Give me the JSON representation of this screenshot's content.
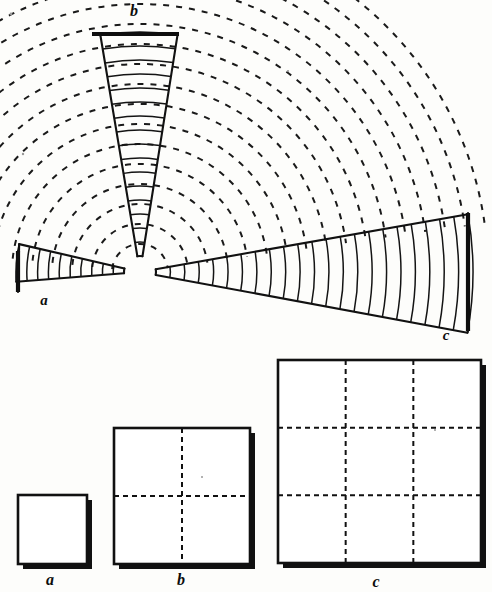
{
  "figure": {
    "background_color": "#fdfdfb",
    "ink_color": "#111111",
    "source_point": {
      "x": 140,
      "y": 272
    }
  },
  "beams": [
    {
      "id": "a",
      "label": "a",
      "label_x": 44,
      "label_y": 305,
      "distance_units": 1,
      "rung_count": 10,
      "direction": "left",
      "start_angle_deg": 175.5,
      "end_angle_deg": 193.0,
      "inner_radius": 16,
      "outer_radius": 124,
      "cap_x": 18,
      "cap_top_y": 251,
      "cap_bottom_y": 292
    },
    {
      "id": "b",
      "label": "b",
      "label_x": 134,
      "label_y": 16,
      "distance_units": 2,
      "rung_count": 16,
      "direction": "up",
      "start_angle_deg": 260.5,
      "end_angle_deg": 279.0,
      "inner_radius": 16,
      "outer_radius": 240,
      "cap_left_x": 92,
      "cap_right_x": 179,
      "cap_y": 34
    },
    {
      "id": "c",
      "label": "c",
      "label_x": 446,
      "label_y": 340,
      "distance_units": 3,
      "rung_count": 22,
      "direction": "right",
      "start_angle_deg": -10.0,
      "end_angle_deg": 10.5,
      "inner_radius": 16,
      "outer_radius": 333,
      "cap_x": 468,
      "cap_top_y": 213,
      "cap_bottom_y": 331
    }
  ],
  "wavefronts": {
    "style": "dashed",
    "dash_pattern": "6 7",
    "arc_count": 17,
    "radius_start": 28,
    "radius_step": 20,
    "sweep_start_angle_deg": 186,
    "sweep_end_angle_deg": 352,
    "stroke_width": 2.0
  },
  "squares": [
    {
      "id": "a",
      "label": "a",
      "label_x": 50,
      "label_y": 585,
      "x": 18,
      "y": 495,
      "size": 69,
      "divisions": 1,
      "area_units": 1,
      "grid_visible": false
    },
    {
      "id": "b",
      "label": "b",
      "label_x": 181,
      "label_y": 585,
      "x": 114,
      "y": 428,
      "size": 136,
      "divisions": 2,
      "area_units": 4,
      "grid_visible": true
    },
    {
      "id": "c",
      "label": "c",
      "label_x": 376,
      "label_y": 587,
      "x": 278,
      "y": 360,
      "size": 203,
      "divisions": 3,
      "area_units": 9,
      "grid_visible": true
    }
  ],
  "specks": [
    {
      "x": 11,
      "y": 14,
      "r": 1.4
    },
    {
      "x": 23,
      "y": 154,
      "r": 1.2
    },
    {
      "x": 288,
      "y": 71,
      "r": 1.1
    },
    {
      "x": 202,
      "y": 477,
      "r": 1.0
    },
    {
      "x": 435,
      "y": 430,
      "r": 1.0
    }
  ]
}
